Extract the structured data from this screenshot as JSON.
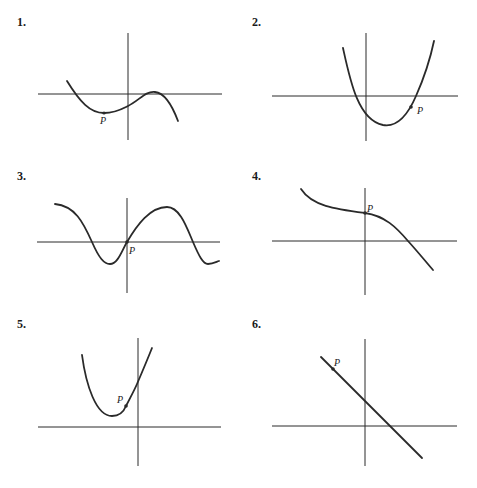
{
  "graphs": [
    {
      "number": "1.",
      "point_label": "P",
      "description": "cubic-like curve: decreasing, local min at P, rises through y-axis below origin, local max near x-axis, then decreasing"
    },
    {
      "number": "2.",
      "point_label": "P",
      "description": "upward parabola with vertex right of y-axis below x-axis; P on right branch just below x-axis"
    },
    {
      "number": "3.",
      "point_label": "P",
      "description": "sinusoidal wave passing through origin; P at origin"
    },
    {
      "number": "4.",
      "point_label": "P",
      "description": "decreasing curve with P on positive y-axis, concave up then concave down"
    },
    {
      "number": "5.",
      "point_label": "P",
      "description": "upward parabola with vertex left of y-axis above x-axis; P on right branch left of y-axis"
    },
    {
      "number": "6.",
      "point_label": "P",
      "description": "straight line with negative slope; P in second quadrant"
    }
  ]
}
